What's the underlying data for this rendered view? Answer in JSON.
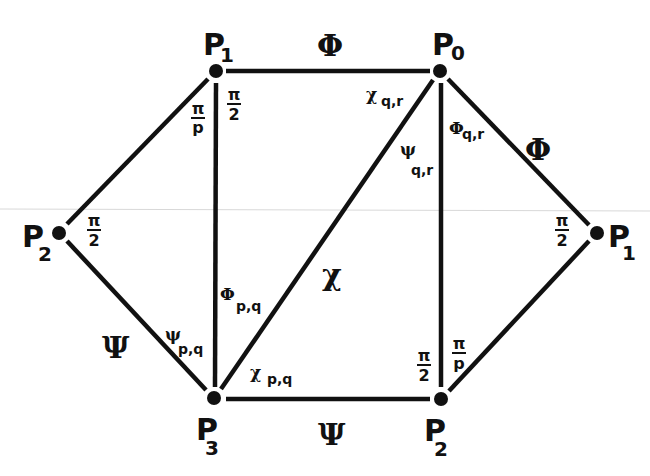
{
  "diagram": {
    "nodes": [
      {
        "id": "P1_top",
        "label": "P",
        "sub": "1",
        "x": 216,
        "y": 71
      },
      {
        "id": "P0",
        "label": "P",
        "sub": "0",
        "x": 440,
        "y": 71
      },
      {
        "id": "P2_left",
        "label": "P",
        "sub": "2",
        "x": 59,
        "y": 233
      },
      {
        "id": "P1_right",
        "label": "P",
        "sub": "1",
        "x": 597,
        "y": 233
      },
      {
        "id": "P3",
        "label": "P",
        "sub": "3",
        "x": 214,
        "y": 398
      },
      {
        "id": "P2_bottom",
        "label": "P",
        "sub": "2",
        "x": 441,
        "y": 399
      }
    ],
    "edges": [
      {
        "from": "P1_top",
        "to": "P0",
        "label": "Φ"
      },
      {
        "from": "P0",
        "to": "P1_right",
        "label": "Φ"
      },
      {
        "from": "P2_left",
        "to": "P1_top",
        "label": ""
      },
      {
        "from": "P2_left",
        "to": "P3",
        "label": "Ψ"
      },
      {
        "from": "P1_top",
        "to": "P3",
        "label": ""
      },
      {
        "from": "P3",
        "to": "P0",
        "label": "χ"
      },
      {
        "from": "P0",
        "to": "P2_bottom",
        "label": ""
      },
      {
        "from": "P3",
        "to": "P2_bottom",
        "label": "Ψ"
      },
      {
        "from": "P2_bottom",
        "to": "P1_right",
        "label": ""
      }
    ],
    "edge_labels": {
      "top": "Φ",
      "upper_right": "Φ",
      "left_lower": "Ψ",
      "diagonal": "χ",
      "bottom": "Ψ"
    },
    "angle_labels": {
      "p1_top_left": {
        "num": "π",
        "den": "p"
      },
      "p1_top_right": {
        "num": "π",
        "den": "2"
      },
      "p0_chi": {
        "symbol": "χ",
        "sub": "q,r"
      },
      "p0_psi": {
        "symbol": "ψ",
        "sub": "q,r"
      },
      "p0_phi": {
        "symbol": "Φ",
        "sub": "q,r"
      },
      "p2_left": {
        "num": "π",
        "den": "2"
      },
      "p1_right": {
        "num": "π",
        "den": "2"
      },
      "p3_psi": {
        "symbol": "ψ",
        "sub": "p,q"
      },
      "p3_phi": {
        "symbol": "Φ",
        "sub": "p,q"
      },
      "p3_chi": {
        "symbol": "χ",
        "sub": "p,q"
      },
      "p2_bottom_left": {
        "num": "π",
        "den": "2"
      },
      "p2_bottom_right": {
        "num": "π",
        "den": "p"
      }
    }
  }
}
